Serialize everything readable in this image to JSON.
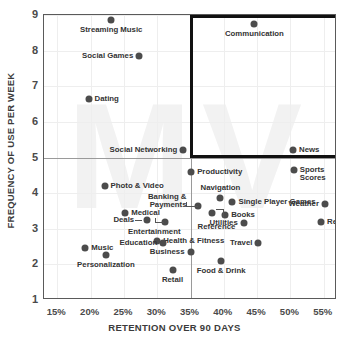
{
  "chart_data": {
    "type": "scatter",
    "title": "",
    "xlabel": "RETENTION OVER 90 DAYS",
    "ylabel": "FREQUENCY OF USE PER WEEK",
    "xlim": [
      13,
      57
    ],
    "ylim": [
      1,
      9
    ],
    "x_ticks": [
      "15%",
      "20%",
      "25%",
      "30%",
      "35%",
      "40%",
      "45%",
      "50%",
      "55%"
    ],
    "x_tick_values": [
      15,
      20,
      25,
      30,
      35,
      40,
      45,
      50,
      55
    ],
    "y_ticks": [
      "1",
      "2",
      "3",
      "4",
      "5",
      "6",
      "7",
      "8",
      "9"
    ],
    "y_tick_values": [
      1,
      2,
      3,
      4,
      5,
      6,
      7,
      8,
      9
    ],
    "grid": true,
    "legend": "none",
    "quadrant_divider_x": 35,
    "quadrant_divider_y": 5,
    "highlight_box": {
      "x_start": 35,
      "x_end": 57,
      "y_start": 5,
      "y_end": 9,
      "color": "#111111"
    },
    "watermark_text": "MV",
    "point_color": "#4c4c4c",
    "points": [
      {
        "label": "Streaming Music",
        "x": 23.1,
        "y": 8.85,
        "label_pos": "below"
      },
      {
        "label": "Communication",
        "x": 44.6,
        "y": 8.75,
        "label_pos": "below"
      },
      {
        "label": "Social Games",
        "x": 27.3,
        "y": 7.85,
        "label_pos": "left"
      },
      {
        "label": "Dating",
        "x": 19.7,
        "y": 6.65,
        "label_pos": "right"
      },
      {
        "label": "Social Networking",
        "x": 33.9,
        "y": 5.2,
        "label_pos": "left"
      },
      {
        "label": "News",
        "x": 50.4,
        "y": 5.2,
        "label_pos": "right"
      },
      {
        "label": "Sports Scores",
        "x": 50.5,
        "y": 4.65,
        "label_pos": "right2"
      },
      {
        "label": "Productivity",
        "x": 35.1,
        "y": 4.6,
        "label_pos": "right"
      },
      {
        "label": "Photo & Video",
        "x": 22.1,
        "y": 4.2,
        "label_pos": "right"
      },
      {
        "label": "Navigation",
        "x": 39.5,
        "y": 3.85,
        "label_pos": "above"
      },
      {
        "label": "Banking & Payments",
        "x": 36.2,
        "y": 3.65,
        "label_pos": "leader-left"
      },
      {
        "label": "Single Player Games",
        "x": 41.3,
        "y": 3.75,
        "label_pos": "right"
      },
      {
        "label": "Weather",
        "x": 55.2,
        "y": 3.7,
        "label_pos": "left"
      },
      {
        "label": "Medical",
        "x": 25.2,
        "y": 3.45,
        "label_pos": "right"
      },
      {
        "label": "Books",
        "x": 40.2,
        "y": 3.4,
        "label_pos": "right"
      },
      {
        "label": "Deals",
        "x": 28.5,
        "y": 3.25,
        "label_pos": "leader-right"
      },
      {
        "label": "Reference",
        "x": 38.3,
        "y": 3.45,
        "label_pos": "leader-below"
      },
      {
        "label": "Reference ",
        "x": 54.6,
        "y": 3.2,
        "label_pos": "right"
      },
      {
        "label": "Utilities",
        "x": 43.0,
        "y": 3.15,
        "label_pos": "left"
      },
      {
        "label": "Entertainment",
        "x": 31.1,
        "y": 3.2,
        "label_pos": "leader-right2"
      },
      {
        "label": "Health & Fitness",
        "x": 30.0,
        "y": 2.65,
        "label_pos": "right"
      },
      {
        "label": "Education",
        "x": 30.9,
        "y": 2.6,
        "label_pos": "left"
      },
      {
        "label": "Travel",
        "x": 45.2,
        "y": 2.6,
        "label_pos": "left"
      },
      {
        "label": "Music",
        "x": 19.2,
        "y": 2.45,
        "label_pos": "right"
      },
      {
        "label": "Business",
        "x": 35.0,
        "y": 2.35,
        "label_pos": "left"
      },
      {
        "label": "Personalization",
        "x": 22.3,
        "y": 2.25,
        "label_pos": "below"
      },
      {
        "label": "Food & Drink",
        "x": 39.6,
        "y": 2.1,
        "label_pos": "below"
      },
      {
        "label": "Retail",
        "x": 32.3,
        "y": 1.85,
        "label_pos": "below"
      }
    ]
  }
}
